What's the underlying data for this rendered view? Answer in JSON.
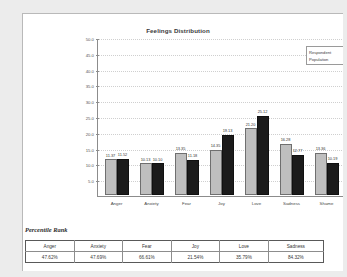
{
  "chart_data": {
    "type": "bar",
    "title": "Feelings Distribution",
    "xlabel": "",
    "ylabel": "",
    "ylim": [
      0,
      50
    ],
    "yticks": [
      "5.0",
      "10.0",
      "15.0",
      "20.0",
      "25.0",
      "30.0",
      "35.0",
      "40.0",
      "45.0",
      "50.0"
    ],
    "ytick_values": [
      5,
      10,
      15,
      20,
      25,
      30,
      35,
      40,
      45,
      50
    ],
    "grid": true,
    "legend_position": "top-right",
    "categories": [
      "Anger",
      "Anxiety",
      "Fear",
      "Joy",
      "Love",
      "Sadness",
      "Shame"
    ],
    "series": [
      {
        "name": "Respondent",
        "color": "#bfbfbf",
        "values": [
          11.37,
          10.13,
          13.35,
          14.35,
          21.2,
          16.28,
          13.36
        ],
        "labels": [
          "11.37",
          "10.13",
          "13.35",
          "14.35",
          "21.20",
          "16.28",
          "13.36"
        ]
      },
      {
        "name": "Population",
        "color": "#1b1b1b",
        "values": [
          11.52,
          10.1,
          11.18,
          19.13,
          25.12,
          12.77,
          10.19
        ],
        "labels": [
          "11.52",
          "10.10",
          "11.18",
          "19.13",
          "25.12",
          "12.77",
          "10.19"
        ]
      }
    ]
  },
  "chart": {
    "title": "Feelings Distribution",
    "legend": [
      {
        "label": "Respondent",
        "swatch": "legend-swatch-respondent"
      },
      {
        "label": "Population",
        "swatch": "legend-swatch-population"
      }
    ]
  },
  "percentile_rank": {
    "caption": "Percentile Rank",
    "columns": [
      "Anger",
      "Anxiety",
      "Fear",
      "Joy",
      "Love",
      "Sadness"
    ],
    "values": [
      "47.62%",
      "47.69%",
      "66.61%",
      "21.54%",
      "35.79%",
      "84.32%"
    ]
  },
  "colors": {
    "series_respondent": "#bfbfbf",
    "series_population": "#1b1b1b",
    "axis": "#8c8c8c",
    "gridline": "#cfcfcf",
    "page": "#ffffff",
    "canvas": "#ececec"
  }
}
